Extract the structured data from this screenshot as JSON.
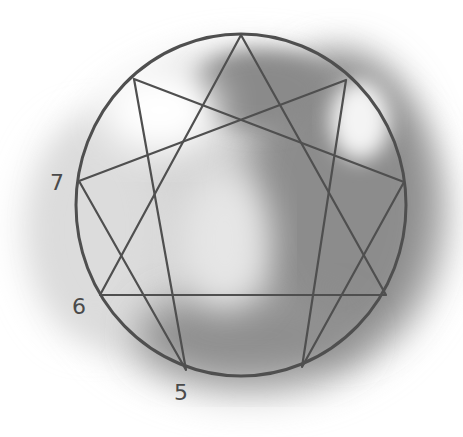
{
  "diagram": {
    "type": "enneagram",
    "colors": {
      "stroke": "#4f4f4f",
      "label": "#4a4a4a",
      "wash_dark": "#7d7d7d",
      "wash_mid": "#a3a3a3",
      "wash_light": "#cfcfcf",
      "background": "#ffffff"
    },
    "circle": {
      "cx": 241,
      "cy": 205,
      "rx": 165,
      "ry": 171
    },
    "points": [
      {
        "id": "9",
        "x": 241,
        "y": 35
      },
      {
        "id": "1",
        "x": 346,
        "y": 80
      },
      {
        "id": "2",
        "x": 404,
        "y": 182
      },
      {
        "id": "3",
        "x": 386,
        "y": 295
      },
      {
        "id": "4",
        "x": 302,
        "y": 367
      },
      {
        "id": "5",
        "x": 186,
        "y": 370
      },
      {
        "id": "6",
        "x": 100,
        "y": 295
      },
      {
        "id": "7",
        "x": 79,
        "y": 181
      },
      {
        "id": "8",
        "x": 134,
        "y": 79
      }
    ],
    "triangle": [
      "9",
      "3",
      "6"
    ],
    "hexad": [
      "1",
      "4",
      "2",
      "8",
      "5",
      "7"
    ],
    "labels": [
      {
        "text": "7",
        "x": 50,
        "y": 172
      },
      {
        "text": "6",
        "x": 72,
        "y": 296
      },
      {
        "text": "5",
        "x": 174,
        "y": 382
      }
    ]
  }
}
